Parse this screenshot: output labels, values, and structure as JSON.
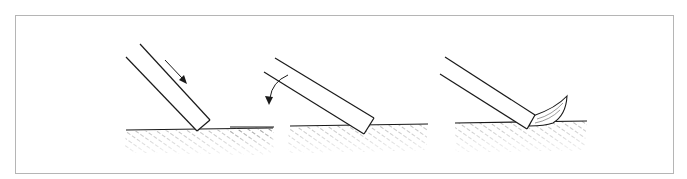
{
  "figure": {
    "colors": {
      "stroke": "#1a1a1a",
      "frame": "#b5b5b5",
      "hatch": "#6a6a6a",
      "background": "#ffffff"
    },
    "panels": [
      {
        "id": 1,
        "step": "tool-pushed-along-axis",
        "arrow": "straight-arrow"
      },
      {
        "id": 2,
        "step": "tool-levered-down",
        "arrow": "curved-arrow"
      },
      {
        "id": 3,
        "step": "chip-lifted-from-surface",
        "arrow": "none"
      }
    ]
  }
}
